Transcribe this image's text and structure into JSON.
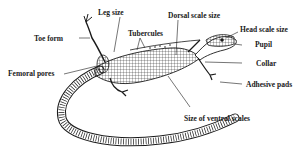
{
  "diagram": {
    "labels": [
      {
        "id": "leg-size",
        "text": "Leg size"
      },
      {
        "id": "toe-form",
        "text": "Toe form"
      },
      {
        "id": "tubercules",
        "text": "Tubercules"
      },
      {
        "id": "dorsal-scale-size",
        "text": "Dorsal scale size"
      },
      {
        "id": "head-scale-size",
        "text": "Head scale size"
      },
      {
        "id": "pupil",
        "text": "Pupil"
      },
      {
        "id": "femoral-pores",
        "text": "Femoral pores"
      },
      {
        "id": "collar",
        "text": "Collar"
      },
      {
        "id": "adhesive-pads",
        "text": "Adhesive pads"
      },
      {
        "id": "size-of-ventral-scales",
        "text": "Size of ventral scales"
      }
    ],
    "colors": {
      "ink": "#1a1a1a",
      "background": "#ffffff"
    }
  }
}
